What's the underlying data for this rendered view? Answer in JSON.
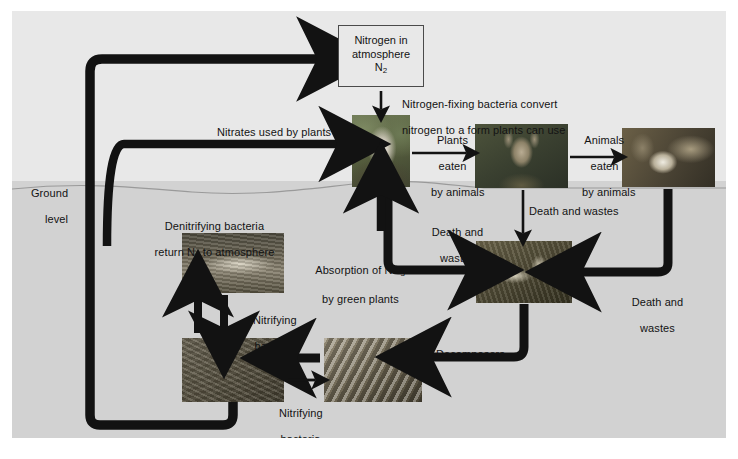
{
  "figure": {
    "type": "diagram",
    "background_color": "#e6e6e6",
    "soil_color": "#d2d2d2",
    "ink_color": "#131313"
  },
  "boxes": [
    {
      "id": "atmosphere",
      "line1": "Nitrogen in",
      "line2": "atmosphere",
      "line3": "N",
      "sub3": "2"
    }
  ],
  "labels": {
    "ground_level": "Ground\nlevel",
    "denitrifying": "Denitrifying bacteria\nreturn N2 to atmosphere",
    "denitrifying_l1": "Denitrifying bacteria",
    "denitrifying_l2a": "return N",
    "denitrifying_sub": "2",
    "denitrifying_l2b": " to atmosphere",
    "nitrogen_fixing_l1": "Nitrogen-fixing bacteria convert",
    "nitrogen_fixing_l2": "nitrogen to a form plants can use",
    "nitrates_used": "Nitrates used by plants",
    "plants_eaten": "Plants\neaten\nby animals",
    "animals_eaten": "Animals\neaten\nby animals",
    "death_wastes_top": "Death and wastes",
    "death_wastes_left": "Death and\nwastes",
    "death_wastes_right": "Death and\nwastes",
    "absorption_l1a": "Absorption of NH",
    "absorption_sub": "3",
    "absorption_l2": "by green plants",
    "nitrifying_upper": "Nitrifying\nbacteria",
    "nitrifying_lower": "Nitrifying\nbacteria",
    "decomposers": "Decomposers"
  },
  "photos": [
    {
      "id": "plant-roots-photo",
      "caption": "plant with roots"
    },
    {
      "id": "deer-photo",
      "caption": "deer"
    },
    {
      "id": "bobcat-photo",
      "caption": "bobcat eating prey"
    },
    {
      "id": "carcass-photo",
      "caption": "animal carcass and remains"
    },
    {
      "id": "soil-upper-photo",
      "caption": "soil cross-section"
    },
    {
      "id": "soil-lower-photo",
      "caption": "soil texture"
    },
    {
      "id": "bacteria-photo",
      "caption": "rod-shaped bacteria micrograph"
    }
  ],
  "arrows": [
    {
      "id": "denitrification-to-atmosphere",
      "from": "soil-lower-photo",
      "to": "atmosphere",
      "style": "thick-curved"
    },
    {
      "id": "nitrogen-fixing-down",
      "from": "atmosphere",
      "to": "plant-roots-photo",
      "style": "thin-straight"
    },
    {
      "id": "nitrates-to-plant",
      "from": "soil-upper-photo",
      "to": "plant-roots-photo",
      "style": "thick-curved"
    },
    {
      "id": "plants-eaten-by-animals",
      "from": "plant-roots-photo",
      "to": "deer-photo",
      "style": "thin-straight"
    },
    {
      "id": "animals-eaten-by-animals",
      "from": "deer-photo",
      "to": "bobcat-photo",
      "style": "thin-straight"
    },
    {
      "id": "deer-death-wastes",
      "from": "deer-photo",
      "to": "carcass-photo",
      "style": "thin-straight"
    },
    {
      "id": "plant-death-wastes",
      "from": "plant-roots-photo",
      "to": "carcass-photo",
      "style": "thick-curved"
    },
    {
      "id": "bobcat-death-wastes",
      "from": "bobcat-photo",
      "to": "carcass-photo",
      "style": "thick-curved"
    },
    {
      "id": "decomposers",
      "from": "carcass-photo",
      "to": "bacteria-photo",
      "style": "thick-curved"
    },
    {
      "id": "bacteria-to-soil",
      "from": "bacteria-photo",
      "to": "soil-lower-photo",
      "style": "thin-straight"
    },
    {
      "id": "soil-to-bacteria",
      "from": "soil-lower-photo",
      "to": "bacteria-photo",
      "style": "thin-straight"
    },
    {
      "id": "nitrifying-down",
      "from": "soil-upper-photo",
      "to": "soil-lower-photo",
      "style": "thin-straight"
    },
    {
      "id": "ammonia-absorption-up",
      "from": "soil-lower-photo",
      "to": "soil-upper-photo",
      "style": "thin-straight"
    },
    {
      "id": "soil-to-plant-uptake",
      "from": "soil",
      "to": "plant-roots-photo",
      "style": "thin-straight"
    }
  ]
}
